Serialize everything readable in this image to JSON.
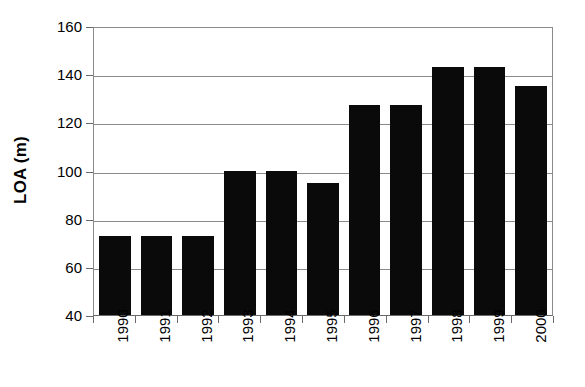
{
  "chart_data": {
    "type": "bar",
    "title": "",
    "subtitle": "",
    "xlabel": "",
    "ylabel": "LOA (m)",
    "categories": [
      "1990",
      "1991",
      "1992",
      "1993",
      "1994",
      "1995",
      "1996",
      "1997",
      "1998",
      "1999",
      "2000"
    ],
    "values": [
      73,
      73,
      73,
      100,
      100,
      95,
      127,
      127,
      143,
      143,
      135
    ],
    "ylim": [
      40,
      160
    ],
    "ytick_values": [
      40,
      60,
      80,
      100,
      120,
      140,
      160
    ],
    "ytick_labels": [
      "40",
      "60",
      "80",
      "100",
      "120",
      "140",
      "160"
    ],
    "ytick_step": 20,
    "grid": true,
    "grid_axis": "y",
    "legend": false,
    "legend_position": "none",
    "bar_color": "#0a0a0a",
    "grid_color": "#8a8a8a",
    "axis_color": "#6a6a6a",
    "background_color": "#ffffff",
    "xtick_label_rotation": -90,
    "ylabel_rotation": -90
  }
}
